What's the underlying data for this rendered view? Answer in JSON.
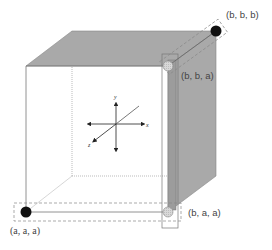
{
  "diagram": {
    "type": "rgb-cube-diagonal-decomposition",
    "colors": {
      "face_fill": "#a9a9a9",
      "edge": "#777777",
      "point_filled": "#111111",
      "point_hollow": "#d0d0d0",
      "dashed": "#888888"
    },
    "points": [
      {
        "id": "aaa",
        "label": "(a, a, a)",
        "style": "filled"
      },
      {
        "id": "bbb",
        "label": "(b, b, b)",
        "style": "filled"
      },
      {
        "id": "bba",
        "label": "(b, b, a)",
        "style": "hollow"
      },
      {
        "id": "baa",
        "label": "(b, a, a)",
        "style": "hollow"
      }
    ],
    "axes": {
      "x": "x",
      "y": "y",
      "z": "z"
    }
  }
}
